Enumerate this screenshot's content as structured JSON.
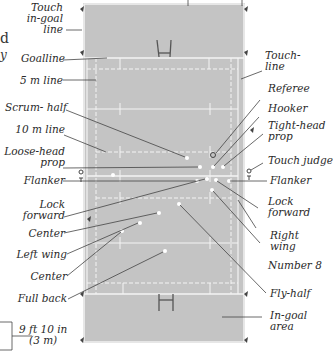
{
  "diagram": {
    "colors": {
      "field": "#c4c4c4",
      "lines": "#f4f4f4",
      "leader": "#444444",
      "text": "#2a2a2a"
    },
    "scale_legend": {
      "line1": "9 ft 10 in",
      "line2": "(3 m)"
    },
    "cut_text": [
      "d",
      "y"
    ],
    "left_labels": [
      {
        "id": "touch-in-goal-line",
        "lines": [
          "Touch",
          "in-goal",
          "line"
        ]
      },
      {
        "id": "goalline",
        "lines": [
          "Goalline"
        ]
      },
      {
        "id": "5m-line",
        "lines": [
          "5 m line"
        ]
      },
      {
        "id": "scrum-half",
        "lines": [
          "Scrum- half"
        ]
      },
      {
        "id": "10m-line",
        "lines": [
          "10 m line"
        ]
      },
      {
        "id": "loose-head-prop",
        "lines": [
          "Loose-head",
          "prop"
        ]
      },
      {
        "id": "flanker-left",
        "lines": [
          "Flanker"
        ]
      },
      {
        "id": "lock-forward-left",
        "lines": [
          "Lock",
          "forward"
        ]
      },
      {
        "id": "center-1",
        "lines": [
          "Center"
        ]
      },
      {
        "id": "left-wing",
        "lines": [
          "Left wing"
        ]
      },
      {
        "id": "center-2",
        "lines": [
          "Center"
        ]
      },
      {
        "id": "full-back",
        "lines": [
          "Full back"
        ]
      }
    ],
    "right_labels": [
      {
        "id": "touch-line",
        "lines": [
          "Touch-",
          "line"
        ]
      },
      {
        "id": "referee",
        "lines": [
          "Referee"
        ]
      },
      {
        "id": "hooker",
        "lines": [
          "Hooker"
        ]
      },
      {
        "id": "tight-head-prop",
        "lines": [
          "Tight-head",
          "prop"
        ]
      },
      {
        "id": "touch-judge",
        "lines": [
          "Touch judge"
        ]
      },
      {
        "id": "flanker-right",
        "lines": [
          "Flanker"
        ]
      },
      {
        "id": "lock-forward-right",
        "lines": [
          "Lock",
          "forward"
        ]
      },
      {
        "id": "right-wing",
        "lines": [
          "Right",
          "wing"
        ]
      },
      {
        "id": "number-8",
        "lines": [
          "Number 8"
        ]
      },
      {
        "id": "fly-half",
        "lines": [
          "Fly-half"
        ]
      },
      {
        "id": "in-goal-area",
        "lines": [
          "In-goal",
          "area"
        ]
      }
    ]
  }
}
